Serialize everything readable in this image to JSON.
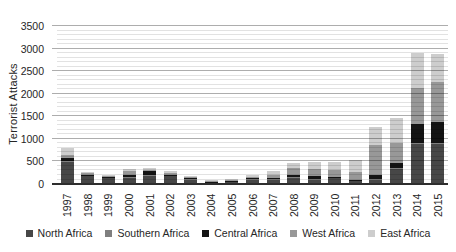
{
  "chart": {
    "y_axis_title": "Terrorist Attacks"
  },
  "chart_data": {
    "type": "bar",
    "stacked": true,
    "title": "",
    "xlabel": "",
    "ylabel": "Terrorist Attacks",
    "ylim": [
      0,
      3500
    ],
    "y_major_unit": 500,
    "y_minor_unit": 100,
    "grid": true,
    "gridlines_over_bars": true,
    "legend_position": "bottom",
    "categories": [
      "1997",
      "1998",
      "1999",
      "2000",
      "2001",
      "2002",
      "2003",
      "2004",
      "2005",
      "2006",
      "2007",
      "2008",
      "2009",
      "2010",
      "2011",
      "2012",
      "2013",
      "2014",
      "2015"
    ],
    "series": [
      {
        "name": "North Africa",
        "color": "#474747",
        "values": [
          500,
          185,
          140,
          150,
          200,
          185,
          115,
          45,
          55,
          110,
          110,
          150,
          110,
          145,
          75,
          110,
          350,
          880,
          880
        ]
      },
      {
        "name": "Southern Africa",
        "color": "#7f7f7f",
        "values": [
          10,
          5,
          5,
          15,
          10,
          5,
          5,
          5,
          5,
          5,
          5,
          5,
          5,
          5,
          5,
          5,
          5,
          20,
          20
        ]
      },
      {
        "name": "Central Africa",
        "color": "#141414",
        "values": [
          70,
          10,
          10,
          40,
          70,
          15,
          10,
          5,
          10,
          10,
          20,
          50,
          55,
          10,
          15,
          90,
          110,
          440,
          480
        ]
      },
      {
        "name": "West Africa",
        "color": "#989898",
        "values": [
          70,
          40,
          35,
          85,
          40,
          45,
          35,
          15,
          20,
          40,
          70,
          145,
          170,
          145,
          180,
          660,
          440,
          780,
          885
        ]
      },
      {
        "name": "East Africa",
        "color": "#cdcdcd",
        "values": [
          150,
          20,
          20,
          50,
          30,
          30,
          20,
          10,
          15,
          35,
          90,
          110,
          140,
          175,
          260,
          405,
          550,
          790,
          615
        ]
      }
    ],
    "approx_totals": [
      800,
      260,
      210,
      340,
      350,
      280,
      185,
      80,
      105,
      200,
      295,
      460,
      480,
      480,
      535,
      1270,
      1455,
      2910,
      2880
    ],
    "colors": {
      "grid_minor": "#e0e0e0",
      "grid_major": "#b0b0b0",
      "axis_line": "#2e2e2e",
      "text": "#262626",
      "background": "#ffffff"
    }
  }
}
